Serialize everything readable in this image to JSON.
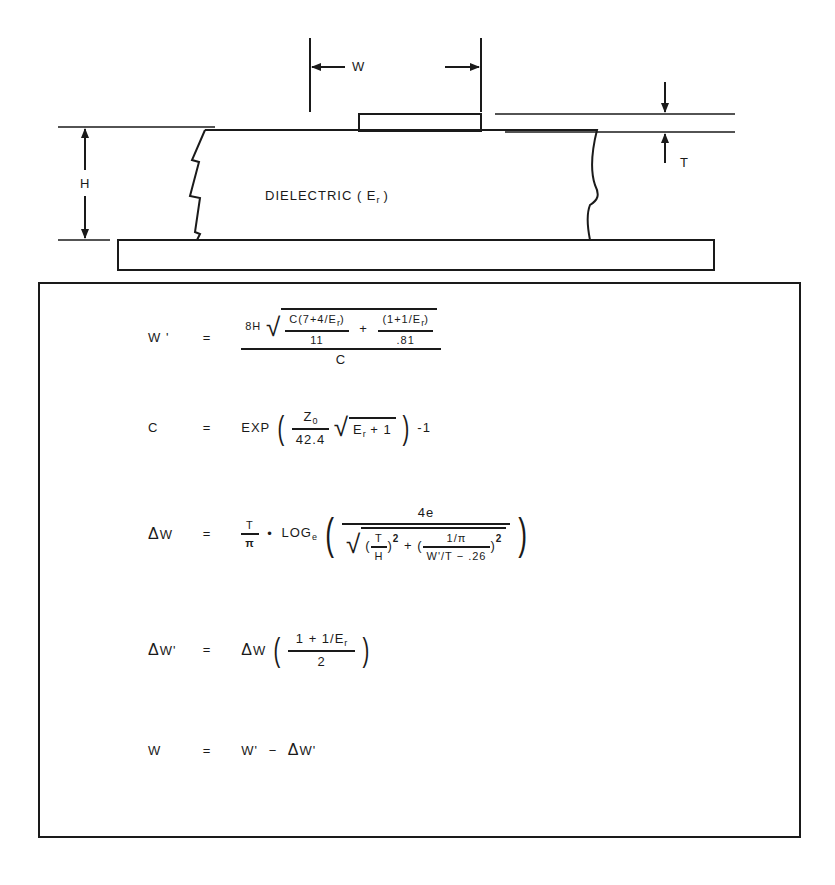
{
  "diagram": {
    "labels": {
      "width": "W",
      "height": "H",
      "thickness": "T",
      "dielectric": "DIELECTRIC ( E",
      "dielectric_sub": "r",
      "dielectric_close": ")"
    },
    "colors": {
      "ink": "#1a1a1a",
      "background": "#ffffff"
    }
  },
  "equations": [
    {
      "id": "w_prime",
      "lhs": "W '",
      "eq": "=",
      "coef": "8H",
      "term1_num": "C(7+4/E",
      "term1_num_sub": "r",
      "term1_num_close": ")",
      "term1_den": "11",
      "plus": "+",
      "term2_num": "(1+1/E",
      "term2_num_sub": "r",
      "term2_num_close": ")",
      "term2_den": ".81",
      "outer_den": "C"
    },
    {
      "id": "c",
      "lhs": "C",
      "eq": "=",
      "func": "EXP",
      "num": "Z",
      "num_sub": "0",
      "den": "42.4",
      "radicand": "E",
      "radicand_sub": "r",
      "radicand_tail": " + 1",
      "tail": "-1"
    },
    {
      "id": "delta_w",
      "lhs_delta": "Δ",
      "lhs": "W",
      "eq": "=",
      "pre_num": "T",
      "pre_den": "π",
      "dot": "•",
      "func": "LOG",
      "func_sub": "e",
      "num": "4e",
      "t1_num": "T",
      "t1_den": "H",
      "sq": "2",
      "plus": "+",
      "t2_num": "1/π",
      "t2_den": "W'/T − .26"
    },
    {
      "id": "delta_w_prime",
      "lhs_delta": "Δ",
      "lhs": "W'",
      "eq": "=",
      "rhs_delta": "Δ",
      "rhs": "W",
      "num": "1 + 1/E",
      "num_sub": "r",
      "den": "2"
    },
    {
      "id": "w",
      "lhs": "W",
      "eq": "=",
      "rhs": "W'",
      "minus": "−",
      "rhs_delta": "Δ",
      "rhs2": "W'"
    }
  ]
}
